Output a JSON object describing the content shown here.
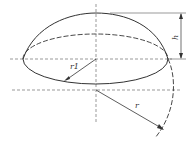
{
  "diagram": {
    "labels": {
      "height": "h",
      "base_radius": "r1",
      "sphere_radius": "r"
    },
    "colors": {
      "stroke": "#333333",
      "background": "#ffffff"
    }
  }
}
